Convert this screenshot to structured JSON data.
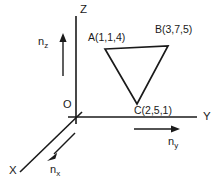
{
  "figure": {
    "title_present": false,
    "background_color": "#ffffff",
    "stroke_color": "#1a1a1a",
    "axes": [
      {
        "name": "z-axis",
        "label": "Z",
        "label_x": 80,
        "label_y": 4
      },
      {
        "name": "y-axis",
        "label": "Y",
        "label_x": 203,
        "label_y": 111
      },
      {
        "name": "x-axis",
        "label": "X",
        "label_x": 9,
        "label_y": 165
      }
    ],
    "origin": {
      "label": "O",
      "label_x": 63,
      "label_y": 99
    },
    "vectors": [
      {
        "name": "n-z",
        "base": "n",
        "sub": "z",
        "label_x": 38,
        "label_y": 36
      },
      {
        "name": "n-y",
        "base": "n",
        "sub": "y",
        "label_x": 168,
        "label_y": 136
      },
      {
        "name": "n-x",
        "base": "n",
        "sub": "x",
        "label_x": 50,
        "label_y": 164
      }
    ],
    "triangle": {
      "name": "triangle-abc",
      "vertices": [
        {
          "id": "A",
          "label": "A(1,1,4)",
          "coords": [
            1,
            1,
            4
          ],
          "px": 105,
          "py": 49,
          "label_x": 88,
          "label_y": 32
        },
        {
          "id": "B",
          "label": "B(3,7,5)",
          "coords": [
            3,
            7,
            5
          ],
          "px": 168,
          "py": 46,
          "label_x": 155,
          "label_y": 24
        },
        {
          "id": "C",
          "label": "C(2,5,1)",
          "coords": [
            2,
            5,
            1
          ],
          "px": 137,
          "py": 104,
          "label_x": 134,
          "label_y": 105
        }
      ]
    }
  }
}
